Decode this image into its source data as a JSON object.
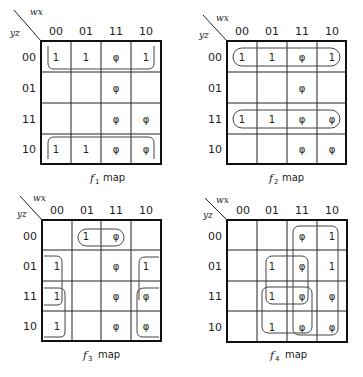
{
  "corner_labels": {
    "top": "wx",
    "bottom": "yz"
  },
  "col_headers": [
    "00",
    "01",
    "11",
    "10"
  ],
  "row_headers": [
    "00",
    "01",
    "11",
    "10"
  ],
  "maps": [
    {
      "name": "f1",
      "caption_f": "f",
      "caption_sub": "1",
      "caption_text": "map",
      "cells": [
        [
          "1",
          "1",
          "φ",
          "1"
        ],
        [
          "",
          "",
          "φ",
          ""
        ],
        [
          "",
          "",
          "φ",
          "φ"
        ],
        [
          "1",
          "1",
          "φ",
          "φ"
        ]
      ]
    },
    {
      "name": "f2",
      "caption_f": "f",
      "caption_sub": "2",
      "caption_text": "map",
      "cells": [
        [
          "1",
          "1",
          "φ",
          "1"
        ],
        [
          "",
          "",
          "φ",
          ""
        ],
        [
          "1",
          "1",
          "φ",
          "φ"
        ],
        [
          "",
          "",
          "φ",
          "φ"
        ]
      ]
    },
    {
      "name": "f3",
      "caption_f": "f",
      "caption_sub": "3",
      "caption_text": "map",
      "cells": [
        [
          "",
          "1",
          "φ",
          ""
        ],
        [
          "1",
          "",
          "φ",
          "1"
        ],
        [
          "1",
          "",
          "φ",
          "φ"
        ],
        [
          "1",
          "",
          "φ",
          "φ"
        ]
      ]
    },
    {
      "name": "f4",
      "caption_f": "f",
      "caption_sub": "4",
      "caption_text": "map",
      "cells": [
        [
          "",
          "",
          "φ",
          "1"
        ],
        [
          "",
          "1",
          "φ",
          "1"
        ],
        [
          "",
          "1",
          "φ",
          "φ"
        ],
        [
          "",
          "1",
          "φ",
          "φ"
        ]
      ]
    }
  ]
}
